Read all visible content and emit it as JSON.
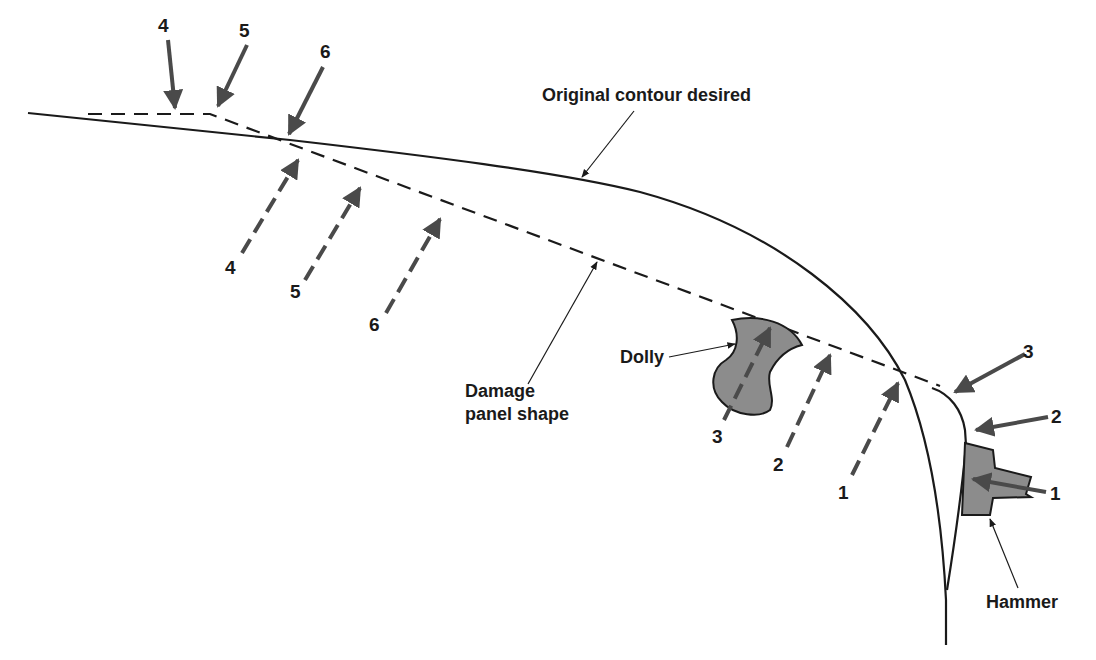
{
  "labels": {
    "original_contour": "Original contour desired",
    "damage_panel_line1": "Damage",
    "damage_panel_line2": "panel shape",
    "dolly": "Dolly",
    "hammer": "Hammer"
  },
  "hammer_steps": {
    "top_4": "4",
    "top_5": "5",
    "top_6": "6",
    "right_3": "3",
    "right_2": "2",
    "right_1": "1"
  },
  "dolly_steps": {
    "below_4": "4",
    "below_5": "5",
    "below_6": "6",
    "below_3": "3",
    "below_2": "2",
    "below_1": "1"
  },
  "colors": {
    "line": "#1a1a1a",
    "arrow": "#4a4a4a",
    "tool_fill": "#8c8c8c"
  }
}
